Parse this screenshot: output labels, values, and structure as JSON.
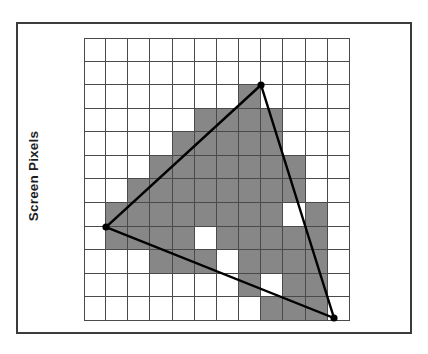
{
  "figure": {
    "axis_label": "Screen Pixels",
    "frame_color": "#3b3b3b",
    "grid_line_color": "#4a4a4a",
    "fill_color": "#878787",
    "background_color": "#ffffff",
    "stroke_color": "#000000"
  },
  "chart_data": {
    "type": "heatmap",
    "title": "",
    "subtitle": "",
    "xlabel": "",
    "ylabel": "Screen Pixels",
    "grid": true,
    "legend": "none",
    "columns": 12,
    "rows": 12,
    "cell_states_legend": {
      "0": "unshaded-white-pixel",
      "1": "shaded-gray-pixel"
    },
    "cells": [
      [
        0,
        0,
        0,
        0,
        0,
        0,
        0,
        0,
        0,
        0,
        0,
        0
      ],
      [
        0,
        0,
        0,
        0,
        0,
        0,
        0,
        0,
        0,
        0,
        0,
        0
      ],
      [
        0,
        0,
        0,
        0,
        0,
        0,
        0,
        1,
        0,
        0,
        0,
        0
      ],
      [
        0,
        0,
        0,
        0,
        0,
        1,
        1,
        1,
        1,
        0,
        0,
        0
      ],
      [
        0,
        0,
        0,
        0,
        1,
        1,
        1,
        1,
        1,
        0,
        0,
        0
      ],
      [
        0,
        0,
        0,
        1,
        1,
        1,
        1,
        1,
        1,
        1,
        0,
        0
      ],
      [
        0,
        0,
        1,
        1,
        1,
        1,
        1,
        1,
        1,
        1,
        0,
        0
      ],
      [
        0,
        1,
        1,
        1,
        1,
        1,
        1,
        1,
        1,
        0,
        1,
        0
      ],
      [
        0,
        1,
        1,
        1,
        1,
        0,
        1,
        1,
        1,
        1,
        1,
        0
      ],
      [
        0,
        0,
        0,
        1,
        1,
        1,
        0,
        1,
        1,
        1,
        1,
        0
      ],
      [
        0,
        0,
        0,
        0,
        0,
        0,
        0,
        1,
        0,
        1,
        1,
        0
      ],
      [
        0,
        0,
        0,
        0,
        0,
        0,
        0,
        0,
        1,
        1,
        1,
        0
      ]
    ],
    "shaded_count": 71,
    "total_cells": 144,
    "triangle": {
      "type": "polygon",
      "closed": true,
      "stroke_color": "#000000",
      "stroke_width_px": 2.4,
      "vertices": [
        {
          "name": "apex-top",
          "grid_x": 7.98,
          "grid_y": 2.0,
          "px_x": 177,
          "px_y": 47
        },
        {
          "name": "vertex-left",
          "grid_x": 1.0,
          "grid_y": 8.0,
          "px_x": 22,
          "px_y": 189
        },
        {
          "name": "vertex-bottom-right",
          "grid_x": 11.3,
          "grid_y": 11.9,
          "px_x": 250,
          "px_y": 280
        }
      ],
      "vertex_marker": {
        "shape": "filled-circle",
        "radius_px": 3.6,
        "color": "#000000"
      }
    },
    "axis_ranges": {
      "x": [
        0,
        12
      ],
      "y": [
        0,
        12
      ]
    }
  }
}
